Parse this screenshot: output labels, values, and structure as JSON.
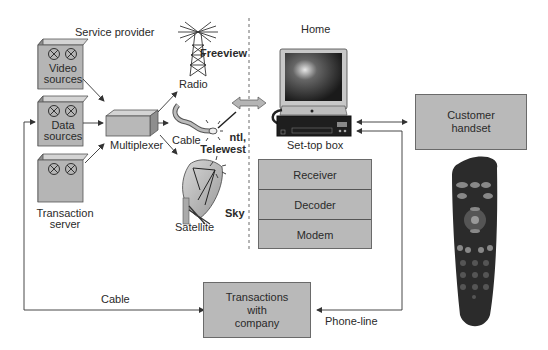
{
  "sections": {
    "service_provider": "Service provider",
    "home": "Home"
  },
  "servers": [
    {
      "label_line1": "Video",
      "label_line2": "sources"
    },
    {
      "label_line1": "Data",
      "label_line2": "sources"
    },
    {
      "label_line1": "Transaction",
      "label_line2": "server"
    }
  ],
  "multiplexer": "Multiplexer",
  "transmission": {
    "radio": "Radio",
    "cable": "Cable",
    "satellite": "Satellite"
  },
  "providers": {
    "freeview": "Freeview",
    "ntl_line1": "ntl,",
    "ntl_line2": "Telewest",
    "sky": "Sky"
  },
  "set_top_box": {
    "label": "Set-top box",
    "components": [
      "Receiver",
      "Decoder",
      "Modem"
    ]
  },
  "customer_handset": {
    "line1": "Customer",
    "line2": "handset"
  },
  "transactions_box": {
    "line1": "Transactions",
    "line2": "with",
    "line3": "company"
  },
  "links": {
    "cable_return": "Cable",
    "phone_line": "Phone-line"
  }
}
